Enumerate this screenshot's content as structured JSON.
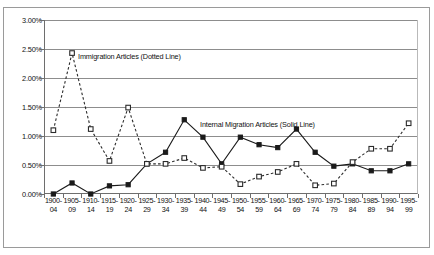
{
  "chart_data": {
    "type": "line",
    "title": "",
    "subtitle": "",
    "xlabel": "",
    "ylabel": "",
    "ylim": [
      0.0,
      3.0
    ],
    "yticks": [
      "0.00%",
      "0.50%",
      "1.00%",
      "1.50%",
      "2.00%",
      "2.50%",
      "3.00%"
    ],
    "ytick_values": [
      0.0,
      0.5,
      1.0,
      1.5,
      2.0,
      2.5,
      3.0
    ],
    "grid": "horizontal",
    "legend_position": "inside-plot",
    "categories": [
      "1900-04",
      "1905-09",
      "1910-14",
      "1915-19",
      "1920-24",
      "1925-29",
      "1930-34",
      "1935-39",
      "1940-44",
      "1945-49",
      "1950-54",
      "1955-59",
      "1960-64",
      "1965-69",
      "1970-74",
      "1975-79",
      "1980-84",
      "1985-89",
      "1990-94",
      "1995-99"
    ],
    "categories_lines": [
      [
        "1900-",
        "04"
      ],
      [
        "1905-",
        "09"
      ],
      [
        "1910-",
        "14"
      ],
      [
        "1915-",
        "19"
      ],
      [
        "1920-",
        "24"
      ],
      [
        "1925-",
        "29"
      ],
      [
        "1930-",
        "34"
      ],
      [
        "1935-",
        "39"
      ],
      [
        "1940-",
        "44"
      ],
      [
        "1945-",
        "49"
      ],
      [
        "1950-",
        "54"
      ],
      [
        "1955-",
        "59"
      ],
      [
        "1960-",
        "64"
      ],
      [
        "1965-",
        "69"
      ],
      [
        "1970-",
        "74"
      ],
      [
        "1975-",
        "79"
      ],
      [
        "1980-",
        "84"
      ],
      [
        "1985-",
        "89"
      ],
      [
        "1990-",
        "94"
      ],
      [
        "1995-",
        "99"
      ]
    ],
    "series": [
      {
        "name": "Immigration Articles",
        "style": "dotted",
        "marker": "open-square",
        "color": "#2b2b2b",
        "values": [
          1.1,
          2.43,
          1.12,
          0.57,
          1.49,
          0.52,
          0.52,
          0.62,
          0.45,
          0.47,
          0.17,
          0.3,
          0.38,
          0.52,
          0.15,
          0.18,
          0.55,
          0.78,
          0.78,
          1.22
        ]
      },
      {
        "name": "Internal Migration Articles",
        "style": "solid",
        "marker": "filled-square",
        "color": "#1a1a1a",
        "values": [
          0.0,
          0.19,
          0.0,
          0.14,
          0.16,
          0.52,
          0.72,
          1.28,
          0.98,
          0.52,
          0.98,
          0.85,
          0.8,
          1.12,
          0.72,
          0.48,
          0.52,
          0.4,
          0.4,
          0.52
        ]
      }
    ],
    "annotations": [
      {
        "id": "immigration",
        "line1": "Immigration Articles",
        "line2": "(Dotted Line)"
      },
      {
        "id": "internal",
        "line1": "Internal Migration Articles",
        "line2": "(Solid Line)"
      }
    ]
  },
  "colors": {
    "grid": "#8d8d8d",
    "axis": "#6e6e6e",
    "frame": "#9a9a9a",
    "background": "#ffffff",
    "series_immigration": "#2b2b2b",
    "series_internal": "#1a1a1a"
  }
}
